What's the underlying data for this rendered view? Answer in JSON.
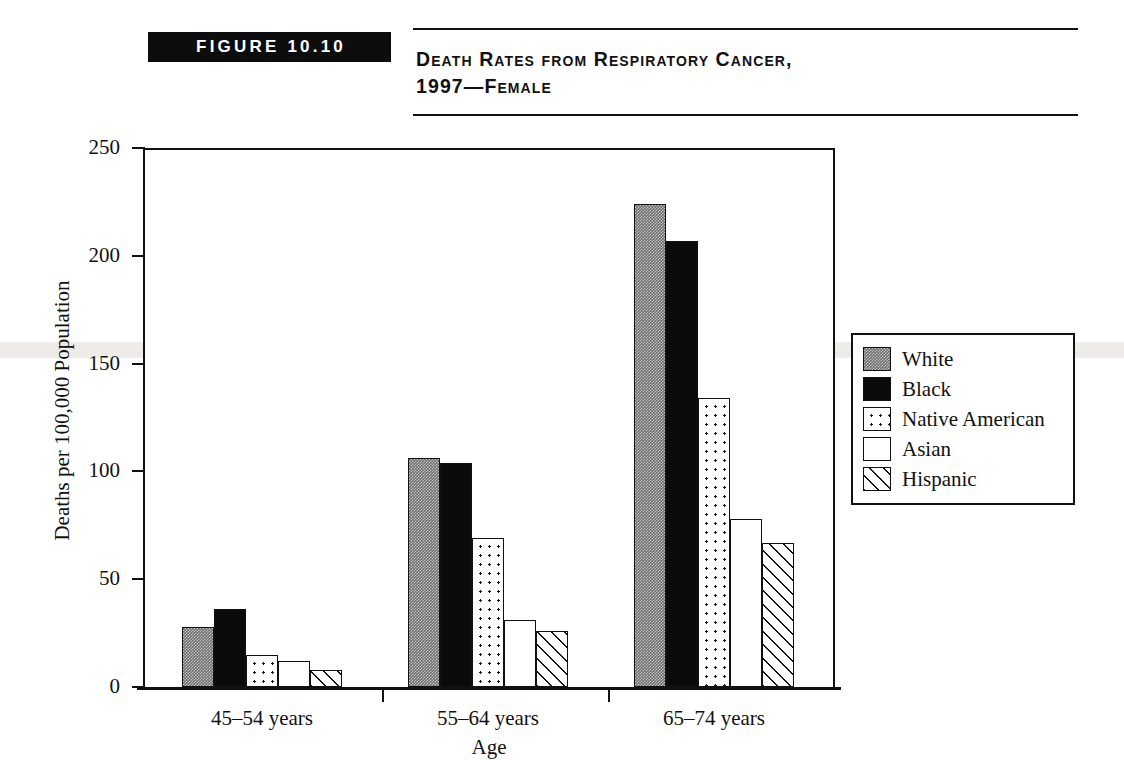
{
  "figure": {
    "badge": "FIGURE 10.10",
    "title": "Death Rates from Respiratory Cancer,\n1997—Female"
  },
  "legend": {
    "items": [
      {
        "label": "White",
        "pattern": "solid-gray",
        "swatch_class": "fill-white-series"
      },
      {
        "label": "Black",
        "pattern": "solid-black",
        "swatch_class": "fill-black-series"
      },
      {
        "label": "Native American",
        "pattern": "dotted",
        "swatch_class": "fill-native-series"
      },
      {
        "label": "Asian",
        "pattern": "empty-white",
        "swatch_class": "fill-asian-series"
      },
      {
        "label": "Hispanic",
        "pattern": "diagonal-hatch",
        "swatch_class": "fill-hispanic-series"
      }
    ]
  },
  "chart_data": {
    "type": "bar",
    "title": "Death Rates from Respiratory Cancer, 1997—Female",
    "xlabel": "Age",
    "ylabel": "Deaths per 100,000 Population",
    "categories": [
      "45–54 years",
      "55–64 years",
      "65–74 years"
    ],
    "series": [
      {
        "name": "White",
        "values": [
          28,
          106,
          224
        ]
      },
      {
        "name": "Black",
        "values": [
          36,
          104,
          207
        ]
      },
      {
        "name": "Native American",
        "values": [
          15,
          69,
          134
        ]
      },
      {
        "name": "Asian",
        "values": [
          12,
          31,
          78
        ]
      },
      {
        "name": "Hispanic",
        "values": [
          8,
          26,
          67
        ]
      }
    ],
    "ylim": [
      0,
      250
    ],
    "yticks": [
      0,
      50,
      100,
      150,
      200,
      250
    ],
    "ytick_labels": [
      "0",
      "50",
      "100",
      "150",
      "200",
      "250"
    ],
    "grid": false,
    "legend_position": "right"
  }
}
